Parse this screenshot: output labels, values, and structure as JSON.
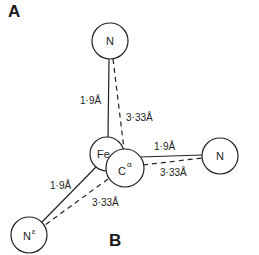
{
  "panels": {
    "a_label": "A",
    "b_label": "B"
  },
  "atoms": {
    "n_top": {
      "label": "N",
      "sup": ""
    },
    "n_right": {
      "label": "N",
      "sup": ""
    },
    "n_bottom_left": {
      "label": "N",
      "sup": "ε"
    },
    "fe": {
      "label": "Fe",
      "sup": ""
    },
    "c_alpha": {
      "label": "C",
      "sup": "α"
    }
  },
  "distances": {
    "fe_n_top": "1·9Å",
    "calpha_n_top": "3·33Å",
    "fe_n_right": "1·9Å",
    "calpha_n_right": "3·33Å",
    "fe_n_bottom_left": "1·9Å",
    "calpha_n_bottom_left": "3·33Å"
  }
}
